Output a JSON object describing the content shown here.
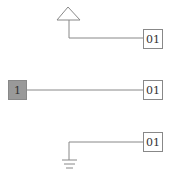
{
  "diagram": {
    "rows": [
      {
        "source": "power-symbol",
        "label": "01"
      },
      {
        "source": "input-port",
        "source_label": "1",
        "label": "01"
      },
      {
        "source": "ground-symbol",
        "label": "01"
      }
    ]
  },
  "colors": {
    "line": "#888888",
    "box_border": "#888888",
    "port_fill": "#999999",
    "text": "#333333"
  }
}
